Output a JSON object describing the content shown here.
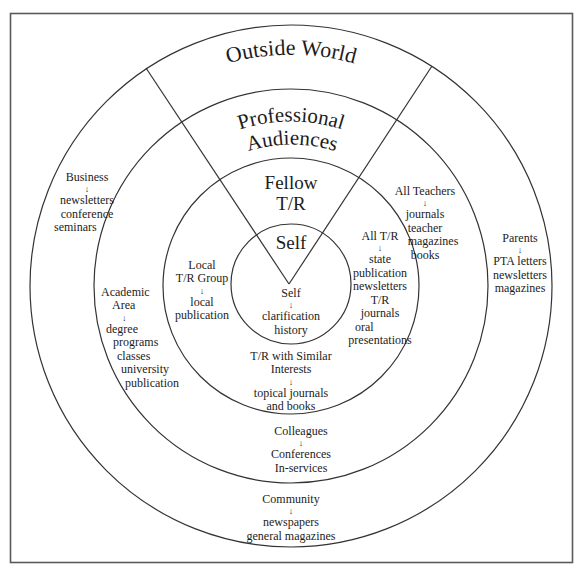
{
  "diagram": {
    "type": "concentric-audience-rings",
    "colors": {
      "stroke": "#333333",
      "text": "#1c1c1c",
      "background": "#ffffff",
      "frame": "#555555"
    },
    "rings": {
      "outside_world": {
        "title": "Outside World"
      },
      "professional": {
        "title_line1": "Professional",
        "title_line2": "Audiences"
      },
      "fellow": {
        "title_line1": "Fellow",
        "title_line2": "T/R"
      },
      "self": {
        "title": "Self"
      }
    },
    "arrow_glyph": "↓",
    "groups": {
      "business": {
        "head": "Business",
        "items": [
          "newsletters",
          "conference",
          "seminars"
        ]
      },
      "parents": {
        "head": "Parents",
        "items": [
          "PTA letters",
          "newsletters",
          "magazines"
        ]
      },
      "community": {
        "head": "Community",
        "items": [
          "newspapers",
          "general magazines"
        ]
      },
      "all_teachers": {
        "head": "All Teachers",
        "items": [
          "journals",
          "teacher",
          "magazines",
          "books"
        ]
      },
      "academic_area": {
        "head_line1": "Academic",
        "head_line2": "Area",
        "items": [
          "degree",
          "programs",
          "classes",
          "university",
          "publication"
        ]
      },
      "colleagues": {
        "head": "Colleagues",
        "items": [
          "Conferences",
          "In-services"
        ]
      },
      "local_tr_group": {
        "head_line1": "Local",
        "head_line2": "T/R Group",
        "items": [
          "local",
          "publication"
        ]
      },
      "all_tr": {
        "head": "All T/R",
        "items": [
          "state",
          "publication",
          "newsletters",
          "T/R",
          "journals",
          "oral",
          "presentations"
        ]
      },
      "tr_similar": {
        "head_line1": "T/R with Similar",
        "head_line2": "Interests",
        "items": [
          "topical journals",
          "and books"
        ]
      },
      "self_inner": {
        "head": "Self",
        "items": [
          "clarification",
          "history"
        ]
      }
    }
  }
}
